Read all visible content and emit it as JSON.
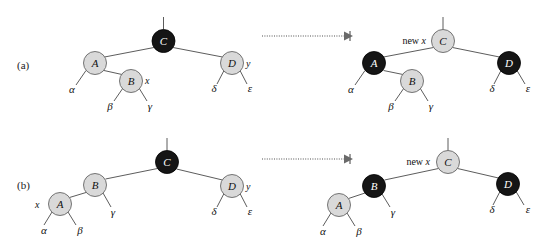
{
  "figure": {
    "panels": [
      {
        "id": "a",
        "label": "(a)",
        "before": {
          "nodes": [
            {
              "key": "C",
              "color": "black",
              "cx": 163.5,
              "cy": 41,
              "r": 11.5
            },
            {
              "key": "A",
              "color": "gray",
              "cx": 95,
              "cy": 63,
              "r": 11.5
            },
            {
              "key": "B",
              "color": "gray",
              "cx": 131,
              "cy": 81,
              "r": 11.5
            },
            {
              "key": "D",
              "color": "gray",
              "cx": 232,
              "cy": 63,
              "r": 11.5
            }
          ],
          "subtrees": [
            {
              "label": "α",
              "x": 72,
              "y": 93
            },
            {
              "label": "β",
              "x": 110,
              "y": 110
            },
            {
              "label": "γ",
              "x": 150,
              "y": 110
            },
            {
              "label": "δ",
              "x": 214,
              "y": 92
            },
            {
              "label": "ε",
              "x": 250,
              "y": 92
            }
          ],
          "annotations": [
            {
              "label": "x",
              "x": 148,
              "y": 84
            },
            {
              "label": "y",
              "x": 249,
              "y": 67
            }
          ]
        },
        "after": {
          "newx_prefix": "new ",
          "newx_var": "x",
          "newx_x": 426,
          "newx_y": 44,
          "nodes": [
            {
              "key": "C",
              "color": "gray",
              "cx": 443,
              "cy": 41,
              "r": 11.5
            },
            {
              "key": "A",
              "color": "black",
              "cx": 374,
              "cy": 63,
              "r": 11.5
            },
            {
              "key": "B",
              "color": "gray",
              "cx": 412,
              "cy": 81,
              "r": 11.5
            },
            {
              "key": "D",
              "color": "black",
              "cx": 509,
              "cy": 63,
              "r": 11.5
            }
          ],
          "subtrees": [
            {
              "label": "α",
              "x": 351,
              "y": 93
            },
            {
              "label": "β",
              "x": 391,
              "y": 110
            },
            {
              "label": "γ",
              "x": 431,
              "y": 110
            },
            {
              "label": "δ",
              "x": 492,
              "y": 92
            },
            {
              "label": "ε",
              "x": 528,
              "y": 92
            }
          ]
        },
        "arrow": {
          "x1": 262,
          "x2": 346,
          "y": 36
        }
      },
      {
        "id": "b",
        "label": "(b)",
        "before": {
          "nodes": [
            {
              "key": "C",
              "color": "black",
              "cx": 167,
              "cy": 162,
              "r": 11.5
            },
            {
              "key": "B",
              "color": "gray",
              "cx": 95,
              "cy": 185,
              "r": 11.5
            },
            {
              "key": "A",
              "color": "gray",
              "cx": 60,
              "cy": 204,
              "r": 11.5
            },
            {
              "key": "D",
              "color": "gray",
              "cx": 232,
              "cy": 186,
              "r": 11.5
            }
          ],
          "subtrees": [
            {
              "label": "α",
              "x": 44,
              "y": 234
            },
            {
              "label": "β",
              "x": 80,
              "y": 234
            },
            {
              "label": "γ",
              "x": 113,
              "y": 216
            },
            {
              "label": "δ",
              "x": 214,
              "y": 215
            },
            {
              "label": "ε",
              "x": 250,
              "y": 215
            }
          ],
          "annotations": [
            {
              "label": "x",
              "x": 38,
              "y": 208
            },
            {
              "label": "y",
              "x": 249,
              "y": 190
            }
          ]
        },
        "after": {
          "newx_prefix": "new ",
          "newx_var": "x",
          "newx_x": 430,
          "newx_y": 165,
          "nodes": [
            {
              "key": "C",
              "color": "gray",
              "cx": 448,
              "cy": 162,
              "r": 11.5
            },
            {
              "key": "B",
              "color": "black",
              "cx": 374,
              "cy": 186,
              "r": 11.5
            },
            {
              "key": "A",
              "color": "gray",
              "cx": 339,
              "cy": 205,
              "r": 11.5
            },
            {
              "key": "D",
              "color": "black",
              "cx": 508,
              "cy": 184,
              "r": 11.5
            }
          ],
          "subtrees": [
            {
              "label": "α",
              "x": 323,
              "y": 235
            },
            {
              "label": "β",
              "x": 359,
              "y": 235
            },
            {
              "label": "γ",
              "x": 393,
              "y": 216
            },
            {
              "label": "δ",
              "x": 492,
              "y": 213
            },
            {
              "label": "ε",
              "x": 528,
              "y": 213
            }
          ]
        },
        "arrow": {
          "x1": 262,
          "x2": 346,
          "y": 159
        }
      }
    ]
  }
}
